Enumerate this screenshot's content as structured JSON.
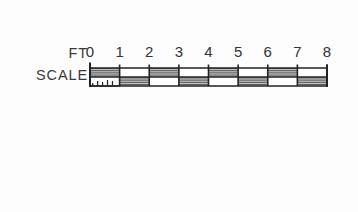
{
  "figure": {
    "kind": "map-scale-bar",
    "background_color": "#fdfdfd",
    "ink_color": "#222222",
    "hatch_color": "#555555"
  },
  "labels": {
    "unit_label": "FT",
    "scale_label": "SCALE"
  },
  "chart_data": {
    "type": "bar",
    "title": "FT SCALE",
    "xlabel": "FT",
    "ylabel": "",
    "units": "feet",
    "categories": [
      "0",
      "1",
      "2",
      "3",
      "4",
      "5",
      "6",
      "7",
      "8"
    ],
    "tick_labels": [
      "0",
      "1",
      "2",
      "3",
      "4",
      "5",
      "6",
      "7",
      "8"
    ],
    "values": [
      0,
      1,
      2,
      3,
      4,
      5,
      6,
      7,
      8
    ],
    "xlim": [
      0,
      8
    ],
    "grid": false,
    "legend": null,
    "bar_start_value": 0,
    "bar_end_value": 8,
    "segment_count": 8,
    "segments": [
      {
        "from": 0,
        "to": 1,
        "fill": "top"
      },
      {
        "from": 1,
        "to": 2,
        "fill": "bottom"
      },
      {
        "from": 2,
        "to": 3,
        "fill": "top"
      },
      {
        "from": 3,
        "to": 4,
        "fill": "bottom"
      },
      {
        "from": 4,
        "to": 5,
        "fill": "top"
      },
      {
        "from": 5,
        "to": 6,
        "fill": "bottom"
      },
      {
        "from": 6,
        "to": 7,
        "fill": "top"
      },
      {
        "from": 7,
        "to": 8,
        "fill": "bottom"
      }
    ],
    "subdivision_ticks": {
      "note": "small ascending tenth ticks left of the zero mark",
      "count": 5,
      "heights": [
        3,
        5,
        4,
        6,
        5
      ]
    }
  }
}
